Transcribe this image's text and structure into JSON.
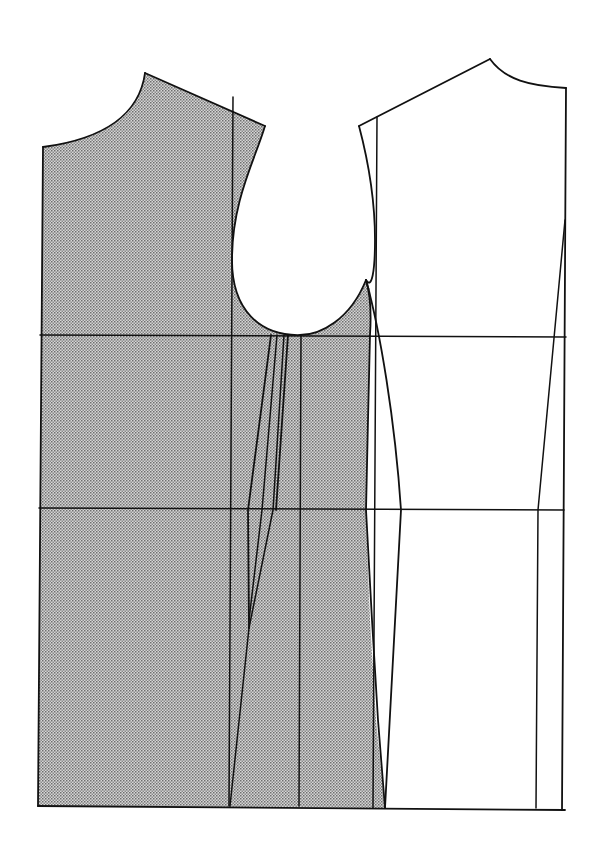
{
  "diagram": {
    "title": "Bodice pattern draft",
    "colors": {
      "background": "#ffffff",
      "stroke": "#111111",
      "shading": "#bdbdbd",
      "shading_dot": "#6e6e6e"
    },
    "pieces": [
      {
        "name": "front-panel",
        "shaded": true
      },
      {
        "name": "back-panel",
        "shaded": false
      }
    ],
    "guide_lines": [
      {
        "name": "chest-line",
        "y": 335
      },
      {
        "name": "waist-line",
        "y": 510
      },
      {
        "name": "hem-line",
        "y": 808
      }
    ]
  }
}
